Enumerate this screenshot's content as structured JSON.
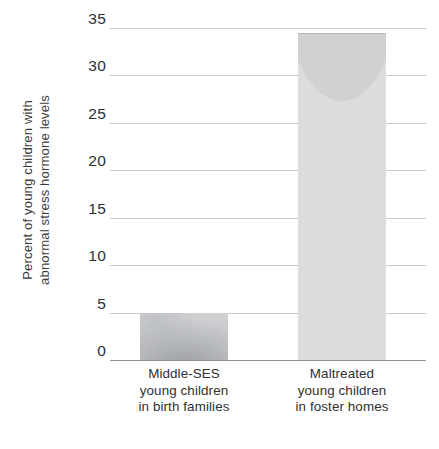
{
  "chart_data": {
    "type": "bar",
    "title": "",
    "subtitle": "",
    "xlabel": "",
    "ylabel": "Percent of young children with abnormal stress hormone levels",
    "ylabel_lines": [
      "Percent of young children with",
      "abnormal stress hormone levels"
    ],
    "categories": [
      "Middle-SES young children in birth families",
      "Maltreated young children in foster homes"
    ],
    "category_lines": [
      [
        "Middle-SES",
        "young children",
        "in birth families"
      ],
      [
        "Maltreated",
        "young children",
        "in foster homes"
      ]
    ],
    "values": [
      5,
      34.5
    ],
    "ylim": [
      0,
      35
    ],
    "yticks": [
      0,
      5,
      10,
      15,
      20,
      25,
      30,
      35
    ],
    "ytick_labels": [
      "0",
      "5",
      "10",
      "15",
      "20",
      "25",
      "30",
      "35"
    ],
    "grid": true,
    "grid_axis": "y",
    "legend": false,
    "legend_position": "none",
    "bar_colors": [
      "#c7c9cc",
      "#dcdddf"
    ],
    "grid_color": "#b9bcc0",
    "axis_color": "#8d9196",
    "text_color": "#303030",
    "background": "#ffffff"
  }
}
